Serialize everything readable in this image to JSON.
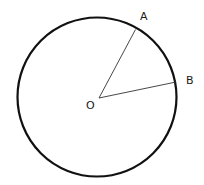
{
  "diagram": {
    "type": "geometry-circle",
    "circle": {
      "center_label": "O",
      "stroke_color": "#111111"
    },
    "points": [
      {
        "label": "A"
      },
      {
        "label": "B"
      }
    ],
    "segments": [
      {
        "from": "O",
        "to": "A"
      },
      {
        "from": "O",
        "to": "B"
      }
    ]
  }
}
